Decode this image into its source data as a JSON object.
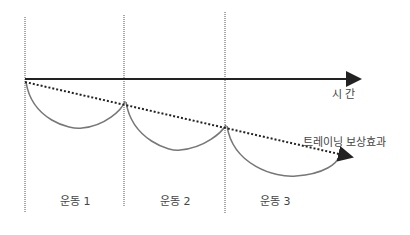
{
  "diagram": {
    "axis_label": "시 간",
    "trend_label": "트레이닝 보상효과",
    "sessions": [
      {
        "label": "운동 1"
      },
      {
        "label": "운동 2"
      },
      {
        "label": "운동 3"
      }
    ],
    "colors": {
      "axis": "#222222",
      "arc": "#777777",
      "divider": "#555555",
      "trend": "#222222",
      "text": "#444444"
    }
  }
}
